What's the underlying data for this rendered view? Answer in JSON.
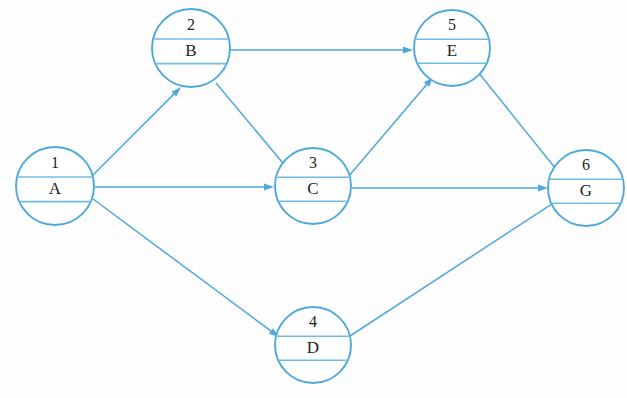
{
  "diagram": {
    "type": "directed-graph",
    "colors": {
      "stroke": "#4ea8da",
      "divider": "#6fbde4",
      "text": "#231f20",
      "background": "#ffffff"
    },
    "nodes": [
      {
        "id": "n1",
        "number": "1",
        "label": "A",
        "cx": 55,
        "cy": 186,
        "r": 39
      },
      {
        "id": "n2",
        "number": "2",
        "label": "B",
        "cx": 191,
        "cy": 48,
        "r": 39
      },
      {
        "id": "n3",
        "number": "3",
        "label": "C",
        "cx": 313,
        "cy": 186,
        "r": 38
      },
      {
        "id": "n4",
        "number": "4",
        "label": "D",
        "cx": 313,
        "cy": 345,
        "r": 38
      },
      {
        "id": "n5",
        "number": "5",
        "label": "E",
        "cx": 452,
        "cy": 48,
        "r": 38
      },
      {
        "id": "n6",
        "number": "6",
        "label": "G",
        "cx": 586,
        "cy": 188,
        "r": 38
      }
    ],
    "edges": [
      {
        "id": "e1",
        "from": "A",
        "to": "B",
        "x1": 92,
        "y1": 176,
        "x2": 181,
        "y2": 87
      },
      {
        "id": "e2",
        "from": "B",
        "to": "E",
        "x1": 230,
        "y1": 50,
        "x2": 413,
        "y2": 50
      },
      {
        "id": "e3",
        "from": "B",
        "to": "C",
        "x1": 216,
        "y1": 83,
        "x2": 297,
        "y2": 180
      },
      {
        "id": "e4",
        "from": "A",
        "to": "C",
        "x1": 94,
        "y1": 187,
        "x2": 274,
        "y2": 187
      },
      {
        "id": "e5",
        "from": "C",
        "to": "E",
        "x1": 348,
        "y1": 177,
        "x2": 433,
        "y2": 77
      },
      {
        "id": "e6",
        "from": "C",
        "to": "G",
        "x1": 352,
        "y1": 188,
        "x2": 548,
        "y2": 188
      },
      {
        "id": "e7",
        "from": "E",
        "to": "G",
        "x1": 478,
        "y1": 72,
        "x2": 568,
        "y2": 184
      },
      {
        "id": "e8",
        "from": "A",
        "to": "D",
        "x1": 89,
        "y1": 196,
        "x2": 279,
        "y2": 337
      },
      {
        "id": "e9",
        "from": "D",
        "to": "G",
        "x1": 350,
        "y1": 336,
        "x2": 564,
        "y2": 196
      }
    ]
  }
}
